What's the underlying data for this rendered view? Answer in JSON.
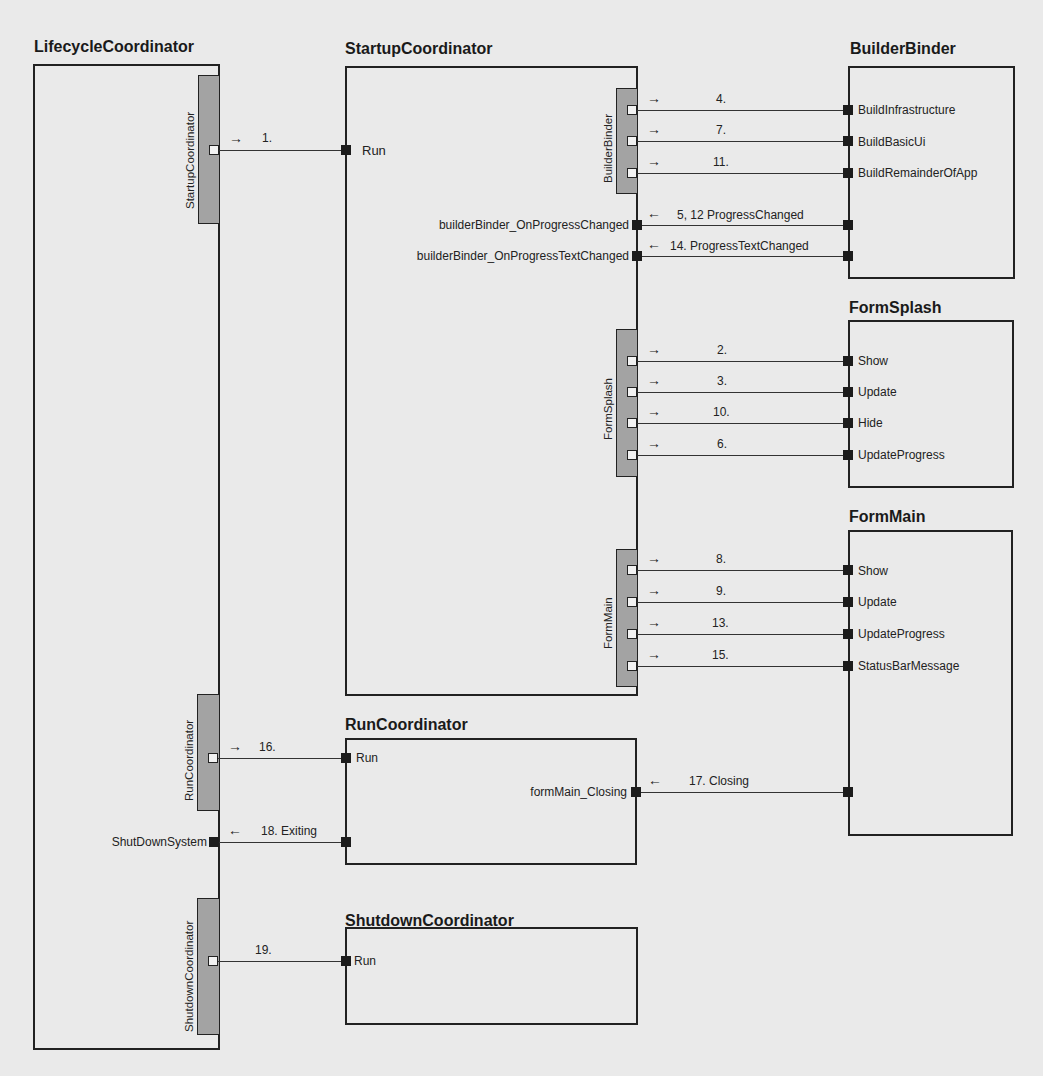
{
  "components": {
    "lifecycle": {
      "title": "LifecycleCoordinator"
    },
    "startup": {
      "title": "StartupCoordinator"
    },
    "builder": {
      "title": "BuilderBinder"
    },
    "splash": {
      "title": "FormSplash"
    },
    "main": {
      "title": "FormMain"
    },
    "run": {
      "title": "RunCoordinator"
    },
    "shutdown": {
      "title": "ShutdownCoordinator"
    }
  },
  "bars": {
    "lc_startup": "StartupCoordinator",
    "lc_run": "RunCoordinator",
    "lc_shutdown": "ShutdownCoordinator",
    "sc_builder": "BuilderBinder",
    "sc_splash": "FormSplash",
    "sc_main": "FormMain"
  },
  "methods": {
    "startup_run": "Run",
    "builder": [
      "BuildInfrastructure",
      "BuildBasicUi",
      "BuildRemainderOfApp"
    ],
    "splash": [
      "Show",
      "Update",
      "Hide",
      "UpdateProgress"
    ],
    "main": [
      "Show",
      "Update",
      "UpdateProgress",
      "StatusBarMessage"
    ],
    "run_run": "Run",
    "shutdown_run": "Run"
  },
  "handlers": {
    "progress_changed": "builderBinder_OnProgressChanged",
    "progress_text_changed": "builderBinder_OnProgressTextChanged",
    "form_main_closing": "formMain_Closing",
    "shut_down_system": "ShutDownSystem"
  },
  "messages": {
    "m1": "1.",
    "builder": [
      "4.",
      "7.",
      "11."
    ],
    "progress_changed": "5, 12  ProgressChanged",
    "progress_text_changed": "14. ProgressTextChanged",
    "splash": [
      "2.",
      "3.",
      "10.",
      "6."
    ],
    "main": [
      "8.",
      "9.",
      "13.",
      "15."
    ],
    "m16": "16.",
    "m17": "17. Closing",
    "m18": "18. Exiting",
    "m19": "19."
  },
  "arrows": {
    "right": "→",
    "left": "←"
  }
}
